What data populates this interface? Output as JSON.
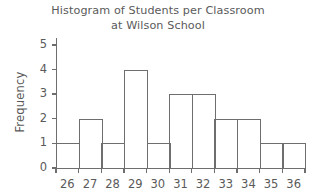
{
  "chart_data": {
    "type": "bar",
    "title": "Histogram of Students per Classroom at Wilson School",
    "title_lines": [
      "Histogram of Students per Classroom",
      "at Wilson School"
    ],
    "xlabel": "",
    "ylabel": "Frequency",
    "categories": [
      "26",
      "27",
      "28",
      "29",
      "30",
      "31",
      "32",
      "33",
      "34",
      "35",
      "36"
    ],
    "values": [
      1,
      2,
      1,
      4,
      1,
      3,
      3,
      2,
      2,
      1,
      1
    ],
    "ylim": [
      0,
      5
    ],
    "ytick_labels": [
      "0",
      "1",
      "2",
      "3",
      "4",
      "5"
    ],
    "ytick_values": [
      0,
      1,
      2,
      3,
      4,
      5
    ],
    "grid": false,
    "legend": null,
    "colors": {
      "bar_outline": "#6e6e6e",
      "bar_fill": "#ffffff",
      "axis": "#6e6e6e",
      "text": "#5a5a5a",
      "background": "#ffffff"
    }
  }
}
